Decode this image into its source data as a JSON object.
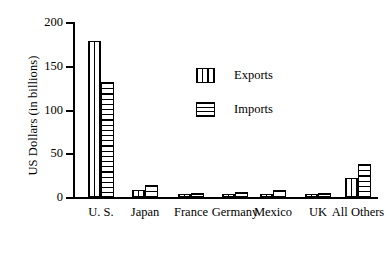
{
  "chart_data": {
    "type": "bar",
    "title": "",
    "xlabel": "",
    "ylabel": "US Dollars (in billions)",
    "ylim": [
      0,
      200
    ],
    "yticks": [
      0,
      50,
      100,
      150,
      200
    ],
    "ytick_labels": [
      "0",
      "50",
      "100",
      "150",
      "200"
    ],
    "grid": false,
    "legend_position": "inside-upper-center",
    "categories": [
      "U. S.",
      "Japan",
      "France",
      "Germany",
      "Mexico",
      "UK",
      "All Others"
    ],
    "series": [
      {
        "name": "Exports",
        "pattern": "vertical-stripes",
        "values": [
          178,
          8,
          3,
          3,
          3,
          3,
          22
        ]
      },
      {
        "name": "Imports",
        "pattern": "horizontal-stripes",
        "values": [
          132,
          14,
          5,
          6,
          8,
          5,
          38
        ]
      }
    ]
  },
  "axis": {
    "y_label": "US Dollars (in billions)"
  },
  "legend": {
    "items": [
      {
        "label": "Exports",
        "swatch": "vertical-stripes-swatch"
      },
      {
        "label": "Imports",
        "swatch": "horizontal-stripes-swatch"
      }
    ]
  }
}
